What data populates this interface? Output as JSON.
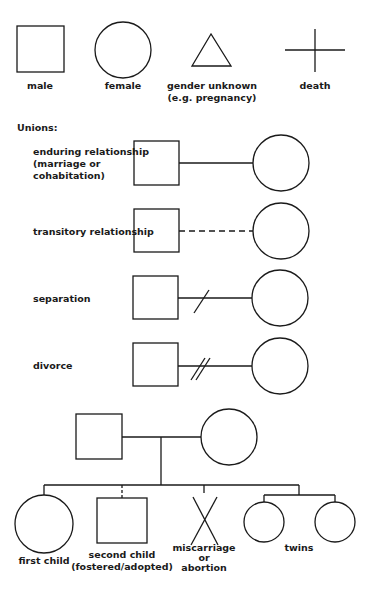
{
  "symbols": {
    "male": "male",
    "female": "female",
    "gender_unknown": [
      "gender unknown",
      "(e.g. pregnancy)"
    ],
    "death": "death"
  },
  "unions": {
    "heading": "Unions:",
    "enduring": [
      "enduring relationship",
      "(marriage or",
      "cohabitation)"
    ],
    "transitory": "transitory relationship",
    "separation": "separation",
    "divorce": "divorce"
  },
  "family": {
    "first_child": "first child",
    "second_child": [
      "second child",
      "(fostered/adopted)"
    ],
    "miscarriage": [
      "miscarriage",
      "or",
      "abortion"
    ],
    "twins": "twins"
  },
  "colors": {
    "stroke": "#1a1a1a",
    "background": "#ffffff"
  }
}
